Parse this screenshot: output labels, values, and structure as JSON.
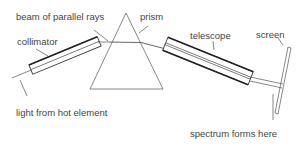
{
  "diagram": {
    "labels": {
      "beam": "beam of parallel rays",
      "prism": "prism",
      "collimator": "collimator",
      "telescope": "telescope",
      "screen": "screen",
      "light_source": "light from hot element",
      "spectrum": "spectrum forms here"
    },
    "colors": {
      "line": "#555555",
      "text": "#444444",
      "background": "#ffffff"
    }
  }
}
